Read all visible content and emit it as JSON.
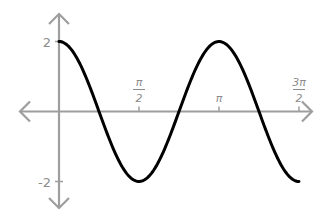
{
  "chart_data": {
    "type": "line",
    "title": "",
    "xlabel": "",
    "ylabel": "",
    "function": "y = 2cos(2x)",
    "x_range": [
      0,
      4.712
    ],
    "ylim": [
      -2,
      2
    ],
    "grid": false,
    "legend": null,
    "x_ticks": [
      {
        "value": 1.5708,
        "num": "π",
        "den": "2"
      },
      {
        "value": 3.1416,
        "num": "π",
        "den": ""
      },
      {
        "value": 4.7124,
        "num": "3π",
        "den": "2"
      }
    ],
    "y_ticks": [
      {
        "value": 2,
        "label": "2"
      },
      {
        "value": -2,
        "label": "-2"
      }
    ],
    "series": [
      {
        "name": "2cos(2x)",
        "color": "#000000",
        "x": [
          0,
          0.3927,
          0.7854,
          1.1781,
          1.5708,
          1.9635,
          2.3562,
          2.7489,
          3.1416,
          3.5343,
          3.927,
          4.3197,
          4.7124
        ],
        "y": [
          2,
          1.414,
          0,
          -1.414,
          -2,
          -1.414,
          0,
          1.414,
          2,
          1.414,
          0,
          -1.414,
          -2
        ]
      }
    ]
  },
  "style": {
    "axis_color": "#9e9e9e",
    "curve_color": "#000000",
    "label_color": "#8c8c8c"
  }
}
